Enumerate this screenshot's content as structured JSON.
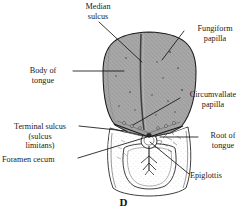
{
  "figure": {
    "letter": "D",
    "background_color": "#ffffff",
    "ink_color": "#1a1a1a",
    "tongue_fill_color": "#a8a8a8",
    "tongue_stipple_color": "#5e5e5e",
    "outline_color": "#1c1c1c"
  },
  "labels": {
    "median_sulcus": "Median\nsulcus",
    "fungiform_papilla": "Fungiform\npapilla",
    "body_of_tongue": "Body of\ntongue",
    "circumvallate_papilla": "Circumvallate\npapilla",
    "terminal_sulcus": "Terminal sulcus\n(sulcus\nlimitans)",
    "root_of_tongue": "Root of\ntongue",
    "foramen_cecum": "Foramen cecum",
    "epiglottis": "Epiglottis"
  }
}
